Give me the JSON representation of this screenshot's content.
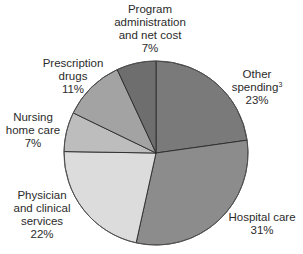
{
  "chart_data": {
    "type": "pie",
    "title": "",
    "start_angle_deg": 0,
    "direction": "clockwise",
    "center": [
      156,
      153
    ],
    "radius": 92,
    "slices": [
      {
        "name": "Other spending",
        "footnote": "3",
        "value": 23,
        "label": "23%",
        "color": "#7a7a7a"
      },
      {
        "name": "Hospital care",
        "footnote": "",
        "value": 31,
        "label": "31%",
        "color": "#8c8c8c"
      },
      {
        "name": "Physician and clinical services",
        "footnote": "",
        "value": 22,
        "label": "22%",
        "color": "#dcdcdc"
      },
      {
        "name": "Nursing home care",
        "footnote": "",
        "value": 7,
        "label": "7%",
        "color": "#bdbdbd"
      },
      {
        "name": "Prescription drugs",
        "footnote": "",
        "value": 11,
        "label": "11%",
        "color": "#a3a3a3"
      },
      {
        "name": "Program administration and net cost",
        "footnote": "",
        "value": 7,
        "label": "7%",
        "color": "#6e6e6e"
      }
    ],
    "categories": [
      "Other spending",
      "Hospital care",
      "Physician and clinical services",
      "Nursing home care",
      "Prescription drugs",
      "Program administration and net cost"
    ],
    "values": [
      23,
      31,
      22,
      7,
      11,
      7
    ],
    "legend": "none (direct labels)"
  },
  "labels": {
    "program": {
      "line1": "Program",
      "line2": "administration",
      "line3": "and net cost",
      "pct": "7%"
    },
    "other": {
      "line1": "Other",
      "line2": "spending",
      "sup": "3",
      "pct": "23%"
    },
    "prescription": {
      "line1": "Prescription",
      "line2": "drugs",
      "pct": "11%"
    },
    "nursing": {
      "line1": "Nursing",
      "line2": "home care",
      "pct": "7%"
    },
    "physician": {
      "line1": "Physician",
      "line2": "and clinical",
      "line3": "services",
      "pct": "22%"
    },
    "hospital": {
      "line1": "Hospital care",
      "pct": "31%"
    }
  },
  "style": {
    "slice_stroke": "#2a2a2a",
    "outline_stroke": "#555555"
  }
}
